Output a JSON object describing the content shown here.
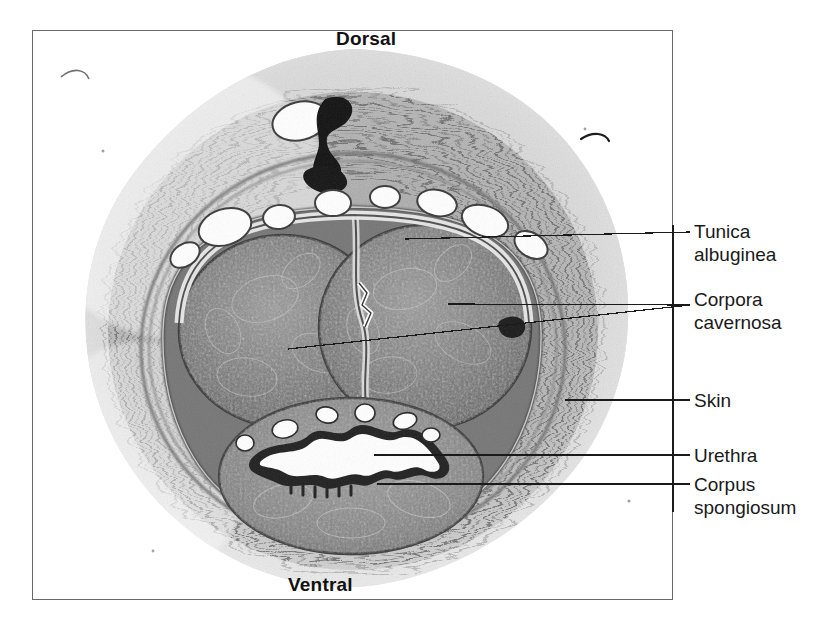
{
  "figure": {
    "kind": "histology-micrograph",
    "stain_tone": "grayscale"
  },
  "orientation": {
    "top_label": "Dorsal",
    "bottom_label": "Ventral"
  },
  "callouts": [
    {
      "id": "tunica",
      "label": "Tunica\nalbuginea"
    },
    {
      "id": "corpora",
      "label": "Corpora\ncavernosa"
    },
    {
      "id": "skin",
      "label": "Skin"
    },
    {
      "id": "urethra",
      "label": "Urethra"
    },
    {
      "id": "spongiosum",
      "label": "Corpus\nspongiosum"
    }
  ],
  "labels": {
    "tunica_albuginea": "Tunica\nalbuginea",
    "corpora_cavernosa": "Corpora\ncavernosa",
    "skin": "Skin",
    "urethra": "Urethra",
    "corpus_spongiosum": "Corpus\nspongiosum"
  },
  "colors": {
    "background": "#ffffff",
    "frame_border": "#6a6a6a",
    "leader_line": "#1a1a1a",
    "text": "#1a1a1a",
    "orientation_text": "#111111",
    "tissue_dark": "#5e5e5e",
    "tissue_mid": "#8d8d8d",
    "tissue_light": "#c9c9c9",
    "lumen_white": "#ffffff"
  },
  "structures": [
    {
      "name": "corpus-cavernosum-left",
      "note": "large rounded erectile body, left of midline"
    },
    {
      "name": "corpus-cavernosum-right",
      "note": "large rounded erectile body, right of midline"
    },
    {
      "name": "septum-pectiniforme",
      "note": "thin midline partition between cavernosa"
    },
    {
      "name": "tunica-albuginea",
      "note": "dense fibrous capsule enclosing erectile bodies"
    },
    {
      "name": "corpus-spongiosum",
      "note": "ventral erectile body surrounding urethra"
    },
    {
      "name": "urethra",
      "note": "star-shaped ventral lumen"
    },
    {
      "name": "dorsal-vein",
      "note": "dark vessel near dorsal surface"
    },
    {
      "name": "dorsal-arteries",
      "note": "paired vessels flanking dorsal vein"
    },
    {
      "name": "skin",
      "note": "outer fibro-connective / dermal layer"
    }
  ]
}
